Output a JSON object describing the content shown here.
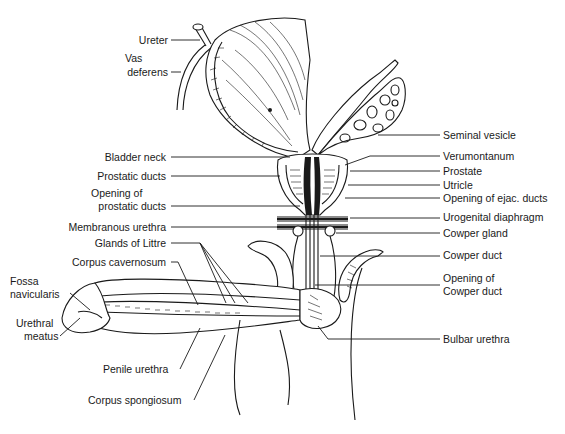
{
  "figure": {
    "labels_left": [
      {
        "id": "ureter",
        "text": "Ureter",
        "x": 198,
        "y": 43
      },
      {
        "id": "vas-deferens-1",
        "text": "Vas",
        "x": 182,
        "y": 62
      },
      {
        "id": "vas-deferens-2",
        "text": "deferens",
        "x": 166,
        "y": 75
      },
      {
        "id": "bladder-neck",
        "text": "Bladder neck",
        "x": 165,
        "y": 160
      },
      {
        "id": "prostatic-ducts",
        "text": "Prostatic ducts",
        "x": 165,
        "y": 179
      },
      {
        "id": "opening-prostatic-ducts-1",
        "text": "Opening of",
        "x": 165,
        "y": 196
      },
      {
        "id": "opening-prostatic-ducts-2",
        "text": "prostatic ducts",
        "x": 165,
        "y": 209
      },
      {
        "id": "membranous-urethra",
        "text": "Membranous urethra",
        "x": 165,
        "y": 230
      },
      {
        "id": "glands-of-littre",
        "text": "Glands of Littre",
        "x": 165,
        "y": 246
      },
      {
        "id": "corpus-cavernosum",
        "text": "Corpus cavernosum",
        "x": 165,
        "y": 265
      },
      {
        "id": "fossa-navicularis-1",
        "text": "Fossa",
        "x": 10,
        "y": 284
      },
      {
        "id": "fossa-navicularis-2",
        "text": "navicularis",
        "x": 10,
        "y": 297
      },
      {
        "id": "urethral-meatus-1",
        "text": "Urethral",
        "x": 16,
        "y": 327
      },
      {
        "id": "urethral-meatus-2",
        "text": "meatus",
        "x": 24,
        "y": 340
      },
      {
        "id": "penile-urethra",
        "text": "Penile urethra",
        "x": 103,
        "y": 373
      },
      {
        "id": "corpus-spongiosum",
        "text": "Corpus spongiosum",
        "x": 88,
        "y": 404
      }
    ],
    "labels_right": [
      {
        "id": "seminal-vesicle",
        "text": "Seminal vesicle",
        "x": 443,
        "y": 139
      },
      {
        "id": "verumontanum",
        "text": "Verumontanum",
        "x": 443,
        "y": 160
      },
      {
        "id": "prostate",
        "text": "Prostate",
        "x": 443,
        "y": 175
      },
      {
        "id": "utricle",
        "text": "Utricle",
        "x": 443,
        "y": 189
      },
      {
        "id": "opening-ejac-ducts",
        "text": "Opening of ejac. ducts",
        "x": 443,
        "y": 202
      },
      {
        "id": "urogenital-diaphragm",
        "text": "Urogenital diaphragm",
        "x": 443,
        "y": 221
      },
      {
        "id": "cowper-gland",
        "text": "Cowper gland",
        "x": 443,
        "y": 237
      },
      {
        "id": "cowper-duct",
        "text": "Cowper duct",
        "x": 443,
        "y": 259
      },
      {
        "id": "opening-cowper-duct-1",
        "text": "Opening of",
        "x": 443,
        "y": 282
      },
      {
        "id": "opening-cowper-duct-2",
        "text": "Cowper duct",
        "x": 443,
        "y": 295
      },
      {
        "id": "bulbar-urethra",
        "text": "Bulbar urethra",
        "x": 443,
        "y": 343
      }
    ]
  },
  "colors": {
    "ink": "#1a1a1a",
    "background": "#ffffff"
  }
}
